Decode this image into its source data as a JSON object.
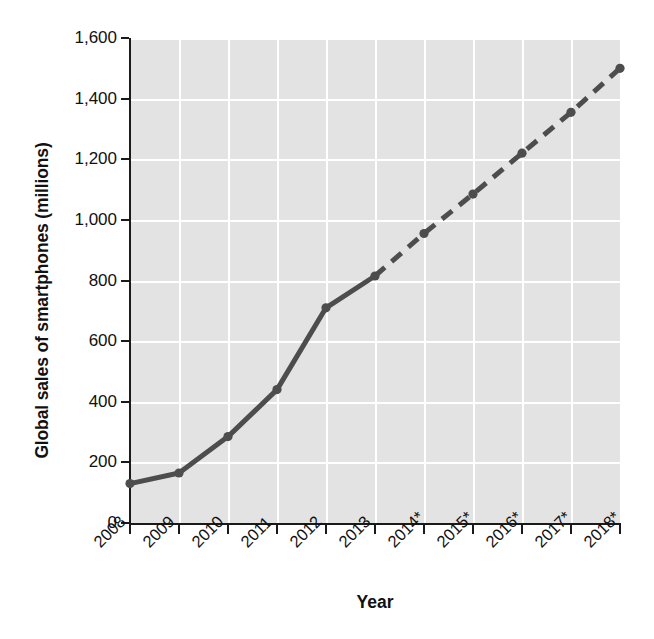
{
  "chart_data": {
    "type": "line",
    "title": "",
    "xlabel": "Year",
    "ylabel": "Global sales of smartphones (millions)",
    "categories": [
      "2008",
      "2009",
      "2010",
      "2011",
      "2012",
      "2013",
      "2014*",
      "2015*",
      "2016*",
      "2017*",
      "2018*"
    ],
    "values": [
      130,
      165,
      285,
      440,
      710,
      815,
      955,
      1085,
      1220,
      1355,
      1500
    ],
    "series": [
      {
        "name": "Global sales of smartphones (millions)",
        "values": [
          130,
          165,
          285,
          440,
          710,
          815,
          955,
          1085,
          1220,
          1355,
          1500
        ],
        "actual_through_index": 5,
        "actual_style": "solid",
        "forecast_style": "dashed",
        "color": "#4d4d4d",
        "marker": "circle"
      }
    ],
    "ylim": [
      0,
      1600
    ],
    "ytick_values": [
      0,
      200,
      400,
      600,
      800,
      1000,
      1200,
      1400,
      1600
    ],
    "ytick_labels": [
      "0",
      "200",
      "400",
      "600",
      "800",
      "1,000",
      "1,200",
      "1,400",
      "1,600"
    ],
    "grid": true,
    "grid_color": "#ffffff",
    "plot_background": "#e3e3e3",
    "legend": "none",
    "footnote_marker": "*",
    "footnote_meaning": "forecast"
  },
  "axes": {
    "y_title": "Global sales of smartphones (millions)",
    "x_title": "Year"
  }
}
